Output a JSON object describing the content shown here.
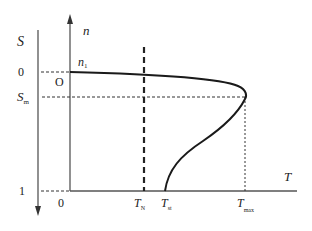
{
  "diagram": {
    "type": "torque-speed / torque-slip characteristic",
    "axes": {
      "slip_axis": {
        "label": "S",
        "direction": "down",
        "ticks": [
          {
            "label": "0",
            "position": "S=0"
          },
          {
            "label": "S",
            "subscript": "m",
            "position": "S=S_m"
          },
          {
            "label": "1",
            "position": "S=1"
          }
        ]
      },
      "speed_axis": {
        "label": "n",
        "direction": "up",
        "marker": {
          "label": "n",
          "subscript": "1"
        }
      },
      "torque_axis": {
        "label": "T",
        "direction": "right",
        "ticks": [
          {
            "label": "0"
          },
          {
            "label": "T",
            "subscript": "N"
          },
          {
            "label": "T",
            "subscript": "st"
          },
          {
            "label": "T",
            "subscript": "max"
          }
        ]
      },
      "origin_label": "O"
    },
    "curve": {
      "description": "Torque curve: starts at (T=0, n=n1, S=0), bends to maximum torque T_max at S_m, then returns to starting torque T_st at S=1",
      "points": [
        "(0, S=0)",
        "(T_max, S_m)",
        "(T_st, S=1)"
      ]
    },
    "reference_lines": [
      {
        "name": "S=0 level",
        "style": "dashed"
      },
      {
        "name": "S_m level",
        "style": "dashed"
      },
      {
        "name": "S=1 level",
        "style": "dashed"
      },
      {
        "name": "T_N rated torque",
        "style": "thick dashed"
      },
      {
        "name": "T_max",
        "style": "dotted"
      }
    ]
  },
  "labels": {
    "S": "S",
    "n": "n",
    "n1_main": "n",
    "n1_sub": "1",
    "s_zero": "0",
    "origin": "O",
    "sm_main": "S",
    "sm_sub": "m",
    "s_one": "1",
    "t_zero": "0",
    "tn_main": "T",
    "tn_sub": "N",
    "tst_main": "T",
    "tst_sub": "st",
    "tmax_main": "T",
    "tmax_sub": "max",
    "T": "T"
  },
  "colors": {
    "axis": "#555555",
    "curve": "#1a1a1a",
    "dashed": "#333333",
    "text": "#222222"
  }
}
